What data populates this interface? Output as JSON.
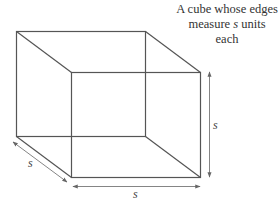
{
  "caption": {
    "line1": "A cube whose edges",
    "line2_pre": "measure ",
    "line2_var": "s",
    "line2_post": " units each"
  },
  "labels": {
    "depth": "s",
    "width": "s",
    "height": "s"
  },
  "colors": {
    "line": "#555555",
    "arrow": "#777777",
    "text": "#333333"
  }
}
